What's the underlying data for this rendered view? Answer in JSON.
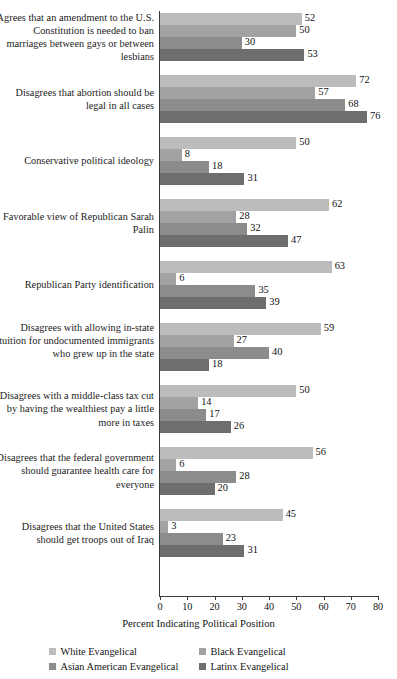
{
  "chart_data": {
    "type": "bar",
    "orientation": "horizontal",
    "title": "",
    "xlabel": "Percent Indicating Political Position",
    "ylabel": "",
    "xlim": [
      0,
      80
    ],
    "xticks": [
      0,
      10,
      20,
      30,
      40,
      50,
      60,
      70,
      80
    ],
    "grid": false,
    "legend_position": "bottom",
    "series": [
      {
        "name": "White Evangelical",
        "color": "#bcbcbc",
        "values": [
          52,
          72,
          50,
          62,
          63,
          59,
          50,
          56,
          45
        ]
      },
      {
        "name": "Black Evangelical",
        "color": "#a2a2a2",
        "values": [
          50,
          57,
          8,
          28,
          6,
          27,
          14,
          6,
          3
        ]
      },
      {
        "name": "Asian American Evangelical",
        "color": "#8c8c8c",
        "values": [
          30,
          68,
          18,
          32,
          35,
          40,
          17,
          28,
          23
        ]
      },
      {
        "name": "Latinx Evangelical",
        "color": "#6e6e6e",
        "values": [
          53,
          76,
          31,
          47,
          39,
          18,
          26,
          20,
          31
        ]
      }
    ],
    "categories": [
      "Agrees that an amendment to the U.S. Constitution is needed to ban marriages between gays or between lesbians",
      "Disagrees that abortion should be legal in all cases",
      "Conservative political ideology",
      "Favorable view of Republican Sarah Palin",
      "Republican Party identification",
      "Disagrees with allowing in-state tuition for undocumented immigrants who grew up in the state",
      "Disagrees with a middle-class tax cut by having the wealthiest pay a little more in taxes",
      "Disagrees that the federal government should guarantee health care for everyone",
      "Disagrees that the United States should get troops out of Iraq"
    ]
  },
  "legend": {
    "items": [
      {
        "label": "White Evangelical",
        "color": "#bcbcbc"
      },
      {
        "label": "Black Evangelical",
        "color": "#a2a2a2"
      },
      {
        "label": "Asian American Evangelical",
        "color": "#8c8c8c"
      },
      {
        "label": "Latinx Evangelical",
        "color": "#6e6e6e"
      }
    ]
  },
  "axis": {
    "x_title": "Percent Indicating Political Position",
    "tick_labels": [
      "0",
      "10",
      "20",
      "30",
      "40",
      "50",
      "60",
      "70",
      "80"
    ]
  }
}
